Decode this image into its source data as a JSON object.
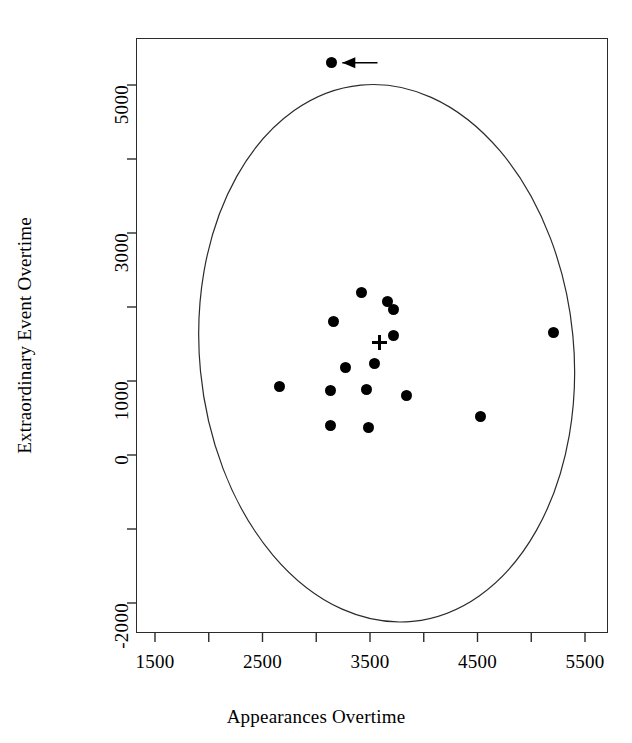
{
  "figure": {
    "width": 632,
    "height": 743,
    "background": "#ffffff",
    "ink_color": "#000000"
  },
  "chart_data": {
    "type": "scatter",
    "title": "",
    "subtitle": "",
    "xlabel": "Appearances Overtime",
    "ylabel": "Extraordinary Event Overtime",
    "xlim": [
      1230,
      5760
    ],
    "ylim": [
      -2400,
      5640
    ],
    "grid": false,
    "legend": null,
    "legend_position": "none",
    "x_ticks_major": [
      1500,
      2500,
      3500,
      4500,
      5500
    ],
    "x_tick_labels": [
      "1500",
      "2500",
      "3500",
      "4500",
      "5500"
    ],
    "x_ticks_minor": [
      2000,
      3000,
      4000,
      5000
    ],
    "y_ticks_major": [
      5000,
      3000,
      1000,
      0,
      -2000
    ],
    "y_tick_labels": [
      "5000",
      "3000",
      "1000",
      "0",
      "-2000"
    ],
    "y_ticks_all": [
      5000,
      4000,
      3000,
      2000,
      1000,
      0,
      -1000,
      -2000
    ],
    "series": [
      {
        "name": "observations",
        "marker": "filled-circle",
        "color": "#000000",
        "points": [
          {
            "x": 3140,
            "y": 5300,
            "flagged": true
          },
          {
            "x": 3420,
            "y": 2190,
            "flagged": false
          },
          {
            "x": 3660,
            "y": 2070,
            "flagged": false
          },
          {
            "x": 3720,
            "y": 1960,
            "flagged": false
          },
          {
            "x": 3160,
            "y": 1800,
            "flagged": false
          },
          {
            "x": 3720,
            "y": 1620,
            "flagged": false
          },
          {
            "x": 5210,
            "y": 1650,
            "flagged": false
          },
          {
            "x": 3540,
            "y": 1230,
            "flagged": false
          },
          {
            "x": 3270,
            "y": 1180,
            "flagged": false
          },
          {
            "x": 2660,
            "y": 920,
            "flagged": false
          },
          {
            "x": 3130,
            "y": 865,
            "flagged": false
          },
          {
            "x": 3470,
            "y": 880,
            "flagged": false
          },
          {
            "x": 3840,
            "y": 800,
            "flagged": false
          },
          {
            "x": 4530,
            "y": 515,
            "flagged": false
          },
          {
            "x": 3130,
            "y": 405,
            "flagged": false
          },
          {
            "x": 3490,
            "y": 365,
            "flagged": false
          }
        ]
      }
    ],
    "centroid": {
      "label": "centroid",
      "marker": "plus",
      "x": 3590,
      "y": 1515
    },
    "confidence_ellipse": {
      "label": "confidence ellipse",
      "center_x": 3655,
      "center_y": 1375,
      "semi_x": 1740,
      "semi_y": 3640,
      "rotation_deg": -5.5,
      "stroke": "#2b2b2b",
      "stroke_width": 1.2,
      "fill": "none"
    },
    "annotations": [
      {
        "type": "arrow",
        "name": "outlier-arrow",
        "text": "",
        "points_to_x": 3140,
        "points_to_y": 5300,
        "tail_x": 3570,
        "tail_y": 5300,
        "direction": "left",
        "color": "#000000"
      }
    ]
  },
  "axes": {
    "x_title": "Appearances Overtime",
    "y_title": "Extraordinary Event Overtime"
  }
}
